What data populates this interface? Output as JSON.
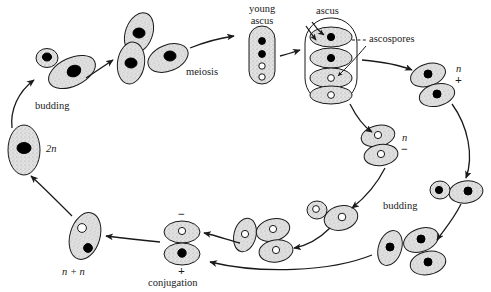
{
  "figure": {
    "type": "biological-life-cycle-diagram",
    "background_color": "#ffffff",
    "ink_color": "#1a1a1a",
    "cell_fill_color": "#d9d9d9",
    "nucleus_dark_color": "#000000",
    "nucleus_light_color": "#ffffff"
  },
  "labels": {
    "budding_left": "budding",
    "budding_right": "budding",
    "meiosis": "meiosis",
    "young_ascus_line1": "young",
    "young_ascus_line2": "ascus",
    "ascus": "ascus",
    "ascospores": "ascospores",
    "conjugation": "conjugation",
    "diploid": "2n",
    "dikaryon": "n + n",
    "haploid_plus_n": "n",
    "haploid_plus_sign": "+",
    "haploid_minus_n": "n",
    "haploid_minus_sign": "−",
    "conjugation_top_sign": "−",
    "conjugation_bottom_sign": "+"
  },
  "stages": [
    {
      "name": "diploid-cell",
      "ploidy": "2n",
      "nucleus": "dark",
      "position": "left"
    },
    {
      "name": "budding-diploid",
      "ploidy": "2n",
      "nucleus": "dark",
      "position": "upper-left"
    },
    {
      "name": "meiosis-cells",
      "count": 3,
      "nucleus": "dark",
      "position": "upper-middle-left"
    },
    {
      "name": "young-ascus",
      "nuclei": 4,
      "nuclei_dark": 2,
      "nuclei_light": 2,
      "position": "top-middle"
    },
    {
      "name": "ascus-with-ascospores",
      "ascospores": 4,
      "ascospores_dark": 2,
      "ascospores_light": 2,
      "position": "top-middle-right"
    },
    {
      "name": "haploid-plus-cells",
      "count": 2,
      "nucleus": "dark",
      "mating_type": "+",
      "position": "right"
    },
    {
      "name": "haploid-minus-cells",
      "count": 2,
      "nucleus": "light",
      "mating_type": "−",
      "position": "middle"
    },
    {
      "name": "budding-plus",
      "nucleus": "dark",
      "mating_type": "+",
      "position": "lower-right"
    },
    {
      "name": "budding-minus",
      "nucleus": "light",
      "mating_type": "−",
      "position": "lower-middle"
    },
    {
      "name": "plus-progeny-cells",
      "count": 3,
      "nucleus": "dark",
      "mating_type": "+",
      "position": "bottom-right"
    },
    {
      "name": "minus-progeny-cells",
      "count": 3,
      "nucleus": "light",
      "mating_type": "−",
      "position": "bottom-middle"
    },
    {
      "name": "conjugating-pair",
      "nucleus_top": "light",
      "nucleus_bottom": "dark",
      "position": "bottom-middle-left"
    },
    {
      "name": "zygote-dikaryon",
      "ploidy": "n + n",
      "nuclei": 2,
      "position": "bottom-left"
    }
  ]
}
